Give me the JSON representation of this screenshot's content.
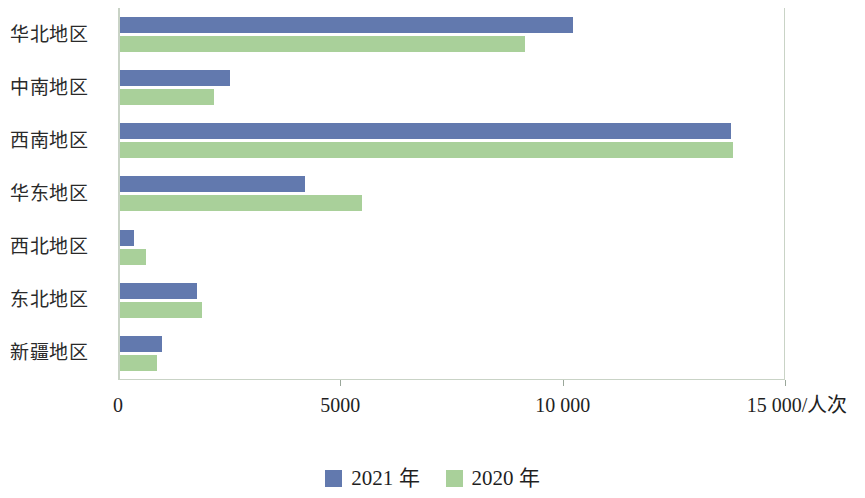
{
  "chart_data": {
    "type": "bar",
    "orientation": "horizontal",
    "title": "",
    "subtitle": "",
    "xlabel": "15 000/人次",
    "ylabel": "",
    "unit": "人次",
    "xlim": [
      0,
      15000
    ],
    "xticks": [
      0,
      5000,
      10000,
      15000
    ],
    "xtick_labels": [
      "0",
      "5000",
      "10 000",
      "15 000/人次"
    ],
    "grid": false,
    "legend_position": "bottom",
    "categories": [
      "新疆地区",
      "东北地区",
      "西北地区",
      "华东地区",
      "西南地区",
      "中南地区",
      "华北地区"
    ],
    "series": [
      {
        "name": "2021 年",
        "color": "#6279ae",
        "values": [
          950,
          1730,
          310,
          4170,
          13740,
          2480,
          10180
        ]
      },
      {
        "name": "2020 年",
        "color": "#a9d09a",
        "values": [
          830,
          1850,
          590,
          5450,
          13790,
          2120,
          9100
        ]
      }
    ]
  },
  "axis": {
    "line_color": "#c9d3c6",
    "tick_color": "#9aa79a",
    "text_color": "#1f1f1f"
  },
  "legend": {
    "items": [
      {
        "label": "2021 年",
        "color": "#6279ae",
        "swatch_name": "legend-swatch-2021"
      },
      {
        "label": "2020 年",
        "color": "#a9d09a",
        "swatch_name": "legend-swatch-2020"
      }
    ]
  }
}
